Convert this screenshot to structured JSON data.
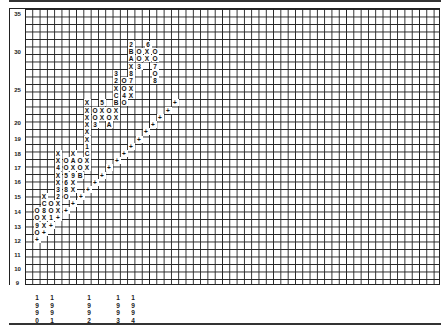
{
  "chart_data": {
    "type": "point-and-figure",
    "title": "",
    "ylabel": "Price",
    "xlabel": "Year",
    "y_ticks": [
      "35",
      "30",
      "25",
      "20",
      "19",
      "18",
      "17",
      "16",
      "15",
      "14",
      "13",
      "12",
      "11",
      "10",
      "9"
    ],
    "ylim": [
      9,
      35
    ],
    "x_year_markers": [
      "1990",
      "1991",
      "1992",
      "1993",
      "1994"
    ],
    "grid": true,
    "legend": "none",
    "annotations": "Numbers 1-9 and letters A, B, C mark the first box of each month (A=Oct, B=Nov, C=Dec); + marks the rising trendline",
    "columns_bottom_to_top_summary": [
      {
        "col": 1,
        "type": "O",
        "from": 12.5,
        "to": 14
      },
      {
        "col": 2,
        "type": "X",
        "from": 13,
        "to": 15
      },
      {
        "col": 3,
        "type": "O",
        "from": 13.5,
        "to": 14.5
      },
      {
        "col": 4,
        "type": "X",
        "from": 14,
        "to": 19
      },
      {
        "col": 5,
        "type": "O",
        "from": 15,
        "to": 17.5
      },
      {
        "col": 6,
        "type": "X",
        "from": 16,
        "to": 18
      },
      {
        "col": 7,
        "type": "O",
        "from": 16.5,
        "to": 17.5
      },
      {
        "col": 8,
        "type": "X",
        "from": 17,
        "to": 23
      },
      {
        "col": 9,
        "type": "O",
        "from": 20.5,
        "to": 21.5
      },
      {
        "col": 10,
        "type": "X",
        "from": 21,
        "to": 22
      },
      {
        "col": 11,
        "type": "O",
        "from": 20.5,
        "to": 21.5
      },
      {
        "col": 12,
        "type": "X",
        "from": 21,
        "to": 27
      },
      {
        "col": 13,
        "type": "O",
        "from": 22,
        "to": 25
      },
      {
        "col": 14,
        "type": "X",
        "from": 24,
        "to": 32
      },
      {
        "col": 15,
        "type": "O",
        "from": 29,
        "to": 31
      },
      {
        "col": 16,
        "type": "X",
        "from": 30,
        "to": 32
      },
      {
        "col": 17,
        "type": "O",
        "from": 25.5,
        "to": 31
      }
    ]
  },
  "y_labels": [
    {
      "t": "35",
      "y": 13
    },
    {
      "t": "30",
      "y": 51
    },
    {
      "t": "25",
      "y": 89
    },
    {
      "t": "20",
      "y": 122
    },
    {
      "t": "19",
      "y": 138
    },
    {
      "t": "18",
      "y": 153
    },
    {
      "t": "17",
      "y": 167
    },
    {
      "t": "16",
      "y": 181
    },
    {
      "t": "15",
      "y": 196
    },
    {
      "t": "14",
      "y": 211
    },
    {
      "t": "13",
      "y": 226
    },
    {
      "t": "12",
      "y": 240
    },
    {
      "t": "11",
      "y": 254
    },
    {
      "t": "10",
      "y": 268
    },
    {
      "t": "9",
      "y": 282
    }
  ],
  "symbols": [
    [
      "2",
      131,
      44
    ],
    [
      "6",
      148,
      44
    ],
    [
      "B",
      131,
      51
    ],
    [
      "O",
      139,
      51
    ],
    [
      "X",
      147,
      51
    ],
    [
      "O",
      155,
      51
    ],
    [
      "A",
      131,
      58
    ],
    [
      "O",
      139,
      58
    ],
    [
      "X",
      147,
      58
    ],
    [
      "O",
      155,
      58
    ],
    [
      "X",
      131,
      66
    ],
    [
      "3",
      139,
      66
    ],
    [
      "7",
      155,
      66
    ],
    [
      "3",
      116,
      73
    ],
    [
      "8",
      131,
      73
    ],
    [
      "O",
      155,
      73
    ],
    [
      "2",
      116,
      80
    ],
    [
      "O",
      124,
      80
    ],
    [
      "7",
      131,
      80
    ],
    [
      "8",
      155,
      80
    ],
    [
      "X",
      116,
      88
    ],
    [
      "O",
      124,
      88
    ],
    [
      "X",
      131,
      88
    ],
    [
      "C",
      116,
      95
    ],
    [
      "4",
      124,
      95
    ],
    [
      "X",
      131,
      95
    ],
    [
      "X",
      87,
      102
    ],
    [
      "5",
      102,
      102
    ],
    [
      "B",
      116,
      102
    ],
    [
      "O",
      124,
      102
    ],
    [
      "X",
      87,
      110
    ],
    [
      "O",
      95,
      110
    ],
    [
      "X",
      102,
      110
    ],
    [
      "O",
      109,
      110
    ],
    [
      "X",
      116,
      110
    ],
    [
      "X",
      87,
      117
    ],
    [
      "O",
      95,
      117
    ],
    [
      "X",
      102,
      117
    ],
    [
      "O",
      109,
      117
    ],
    [
      "X",
      116,
      117
    ],
    [
      "X",
      87,
      124
    ],
    [
      "3",
      95,
      124
    ],
    [
      "A",
      109,
      124
    ],
    [
      "X",
      87,
      131
    ],
    [
      "X",
      87,
      139
    ],
    [
      "1",
      87,
      146
    ],
    [
      "X",
      58,
      153
    ],
    [
      "X",
      73,
      153
    ],
    [
      "C",
      87,
      153
    ],
    [
      "X",
      58,
      160
    ],
    [
      "O",
      66,
      160
    ],
    [
      "A",
      73,
      160
    ],
    [
      "O",
      80,
      160
    ],
    [
      "X",
      87,
      160
    ],
    [
      "4",
      58,
      167
    ],
    [
      "O",
      66,
      167
    ],
    [
      "X",
      73,
      167
    ],
    [
      "O",
      80,
      167
    ],
    [
      "X",
      87,
      167
    ],
    [
      "X",
      58,
      175
    ],
    [
      "5",
      66,
      175
    ],
    [
      "9",
      73,
      175
    ],
    [
      "B",
      80,
      175
    ],
    [
      "X",
      58,
      182
    ],
    [
      "6",
      66,
      182
    ],
    [
      "X",
      73,
      182
    ],
    [
      "3",
      58,
      189
    ],
    [
      "8",
      66,
      189
    ],
    [
      "X",
      73,
      189
    ],
    [
      "X",
      44,
      196
    ],
    [
      "2",
      58,
      196
    ],
    [
      "O",
      66,
      196
    ],
    [
      "C",
      44,
      203
    ],
    [
      "O",
      51,
      203
    ],
    [
      "X",
      58,
      203
    ],
    [
      "O",
      37,
      210
    ],
    [
      "8",
      44,
      210
    ],
    [
      "O",
      51,
      210
    ],
    [
      "X",
      58,
      210
    ],
    [
      "O",
      37,
      217
    ],
    [
      "X",
      44,
      217
    ],
    [
      "1",
      51,
      217
    ],
    [
      "9",
      37,
      225
    ],
    [
      "X",
      44,
      225
    ],
    [
      "O",
      37,
      232
    ],
    [
      "+",
      37,
      239
    ],
    [
      "+",
      44,
      232
    ],
    [
      "+",
      51,
      225
    ],
    [
      "+",
      58,
      217
    ],
    [
      "+",
      66,
      210
    ],
    [
      "+",
      73,
      203
    ],
    [
      "+",
      81,
      196
    ],
    [
      "+",
      88,
      189
    ],
    [
      "+",
      95,
      182
    ],
    [
      "+",
      102,
      175
    ],
    [
      "+",
      109,
      167
    ],
    [
      "+",
      117,
      160
    ],
    [
      "+",
      124,
      153
    ],
    [
      "+",
      131,
      146
    ],
    [
      "+",
      139,
      139
    ],
    [
      "+",
      146,
      131
    ],
    [
      "+",
      153,
      124
    ],
    [
      "+",
      160,
      117
    ],
    [
      "+",
      168,
      110
    ],
    [
      "+",
      175,
      102
    ]
  ],
  "years": [
    {
      "x": 37,
      "digits": [
        "1",
        "9",
        "9",
        "0"
      ]
    },
    {
      "x": 52,
      "digits": [
        "1",
        "9",
        "9",
        "1"
      ]
    },
    {
      "x": 89,
      "digits": [
        "1",
        "9",
        "9",
        "2"
      ]
    },
    {
      "x": 118,
      "digits": [
        "1",
        "9",
        "9",
        "3"
      ]
    },
    {
      "x": 133,
      "digits": [
        "1",
        "9",
        "9",
        "4"
      ]
    }
  ]
}
